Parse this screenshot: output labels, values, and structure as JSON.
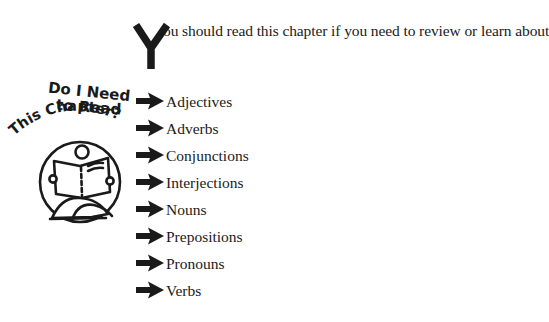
{
  "intro": {
    "dropcap": "Y",
    "text": "ou should read this chapter if you need to review or learn about"
  },
  "badge": {
    "line1": "Do I Need",
    "line2": "to Read",
    "line3": "This Chapter?",
    "icon": "person-reading-book-icon"
  },
  "topics": [
    {
      "label": "Adjectives",
      "icon": "right-arrow-icon"
    },
    {
      "label": "Adverbs",
      "icon": "right-arrow-icon"
    },
    {
      "label": "Conjunctions",
      "icon": "right-arrow-icon"
    },
    {
      "label": "Interjections",
      "icon": "right-arrow-icon"
    },
    {
      "label": "Nouns",
      "icon": "right-arrow-icon"
    },
    {
      "label": "Prepositions",
      "icon": "right-arrow-icon"
    },
    {
      "label": "Pronouns",
      "icon": "right-arrow-icon"
    },
    {
      "label": "Verbs",
      "icon": "right-arrow-icon"
    }
  ],
  "colors": {
    "ink": "#1a1a1a",
    "background": "#ffffff"
  }
}
